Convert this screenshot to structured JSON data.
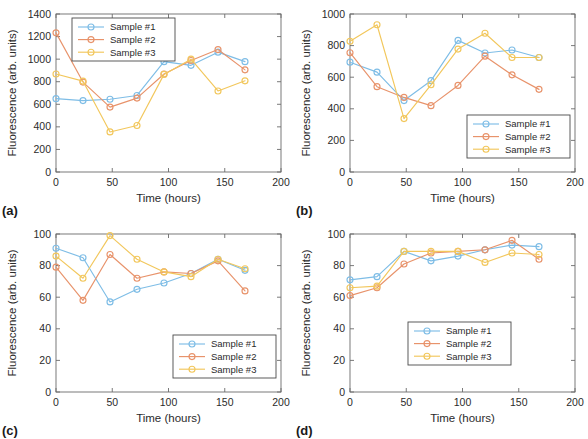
{
  "figure": {
    "panels": [
      {
        "tag": "(a)",
        "xlabel": "Time (hours)",
        "ylabel": "Fluorescence (arb. units)",
        "xlim": [
          0,
          200
        ],
        "ylim": [
          0,
          1400
        ],
        "xticks": [
          0,
          50,
          100,
          150,
          200
        ],
        "yticks": [
          0,
          200,
          400,
          600,
          800,
          1000,
          1200,
          1400
        ],
        "legend_position": "top-center",
        "chart_data": {
          "type": "line",
          "title": "",
          "xlabel": "Time (hours)",
          "ylabel": "Fluorescence (arb. units)",
          "xlim": [
            0,
            200
          ],
          "ylim": [
            0,
            1400
          ],
          "grid": false,
          "x": [
            0,
            24,
            48,
            72,
            96,
            120,
            144,
            168
          ],
          "series": [
            {
              "name": "Sample #1",
              "color": "#7EBDE6",
              "values": [
                650,
                633,
                645,
                678,
                978,
                945,
                1062,
                978
              ]
            },
            {
              "name": "Sample #2",
              "color": "#E8936B",
              "values": [
                1233,
                797,
                575,
                655,
                868,
                988,
                1085,
                905
              ]
            },
            {
              "name": "Sample #3",
              "color": "#F2C75C",
              "values": [
                868,
                805,
                355,
                412,
                865,
                1000,
                718,
                808
              ]
            }
          ]
        }
      },
      {
        "tag": "(b)",
        "xlabel": "Time (hours)",
        "ylabel": "Fluorescence (arb. units)",
        "xlim": [
          0,
          200
        ],
        "ylim": [
          0,
          1000
        ],
        "xticks": [
          0,
          50,
          100,
          150,
          200
        ],
        "yticks": [
          0,
          200,
          400,
          600,
          800,
          1000
        ],
        "legend_position": "lower-right",
        "chart_data": {
          "type": "line",
          "title": "",
          "xlabel": "Time (hours)",
          "ylabel": "Fluorescence (arb. units)",
          "xlim": [
            0,
            200
          ],
          "ylim": [
            0,
            1000
          ],
          "grid": false,
          "x": [
            0,
            24,
            48,
            72,
            96,
            120,
            144,
            168
          ],
          "series": [
            {
              "name": "Sample #1",
              "color": "#7EBDE6",
              "values": [
                695,
                632,
                452,
                578,
                833,
                753,
                772,
                725
              ]
            },
            {
              "name": "Sample #2",
              "color": "#E8936B",
              "values": [
                755,
                540,
                472,
                420,
                548,
                733,
                615,
                523
              ]
            },
            {
              "name": "Sample #3",
              "color": "#F2C75C",
              "values": [
                827,
                932,
                338,
                552,
                778,
                878,
                725,
                725
              ]
            }
          ]
        }
      },
      {
        "tag": "(c)",
        "xlabel": "Time (hours)",
        "ylabel": "Fluorescence (arb. units)",
        "xlim": [
          0,
          200
        ],
        "ylim": [
          0,
          100
        ],
        "xticks": [
          0,
          50,
          100,
          150,
          200
        ],
        "yticks": [
          0,
          20,
          40,
          60,
          80,
          100
        ],
        "legend_position": "lower-right",
        "chart_data": {
          "type": "line",
          "title": "",
          "xlabel": "Time (hours)",
          "ylabel": "Fluorescence (arb. units)",
          "xlim": [
            0,
            200
          ],
          "ylim": [
            0,
            100
          ],
          "grid": false,
          "x": [
            0,
            24,
            48,
            72,
            96,
            120,
            144,
            168
          ],
          "series": [
            {
              "name": "Sample #1",
              "color": "#7EBDE6",
              "values": [
                91,
                85,
                57,
                65,
                69,
                75,
                84,
                77
              ]
            },
            {
              "name": "Sample #2",
              "color": "#E8936B",
              "values": [
                79,
                58,
                87,
                72,
                76,
                75,
                83,
                64
              ]
            },
            {
              "name": "Sample #3",
              "color": "#F2C75C",
              "values": [
                86,
                72,
                99,
                84,
                76,
                73,
                84,
                78
              ]
            }
          ]
        }
      },
      {
        "tag": "(d)",
        "xlabel": "Time (hours)",
        "ylabel": "Fluorescence (arb. units)",
        "xlim": [
          0,
          200
        ],
        "ylim": [
          0,
          100
        ],
        "xticks": [
          0,
          50,
          100,
          150,
          200
        ],
        "yticks": [
          0,
          20,
          40,
          60,
          80,
          100
        ],
        "legend_position": "center",
        "chart_data": {
          "type": "line",
          "title": "",
          "xlabel": "Time (hours)",
          "ylabel": "Fluorescence (arb. units)",
          "xlim": [
            0,
            200
          ],
          "ylim": [
            0,
            100
          ],
          "grid": false,
          "x": [
            0,
            24,
            48,
            72,
            96,
            120,
            144,
            168
          ],
          "series": [
            {
              "name": "Sample #1",
              "color": "#7EBDE6",
              "values": [
                71,
                73,
                89,
                83,
                86,
                90,
                93,
                92
              ]
            },
            {
              "name": "Sample #2",
              "color": "#E8936B",
              "values": [
                61,
                66,
                81,
                88,
                89,
                90,
                96,
                84
              ]
            },
            {
              "name": "Sample #3",
              "color": "#F2C75C",
              "values": [
                66,
                67,
                89,
                89,
                89,
                82,
                88,
                87
              ]
            }
          ]
        }
      }
    ]
  }
}
